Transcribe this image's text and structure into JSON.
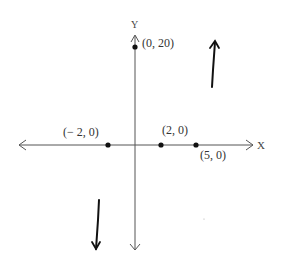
{
  "diagram": {
    "type": "coordinate-graph-sketch",
    "axes": {
      "x_label": "X",
      "y_label": "Y",
      "axis_color": "#555555"
    },
    "points": [
      {
        "label": "(0, 20)",
        "x": 0,
        "y": 20
      },
      {
        "label": "(− 2, 0)",
        "x": -2,
        "y": 0
      },
      {
        "label": "(2, 0)",
        "x": 2,
        "y": 0
      },
      {
        "label": "(5, 0)",
        "x": 5,
        "y": 0
      }
    ],
    "end_behavior": {
      "right": "up-arrow",
      "left": "down-arrow"
    },
    "ink_color": "#111111"
  }
}
